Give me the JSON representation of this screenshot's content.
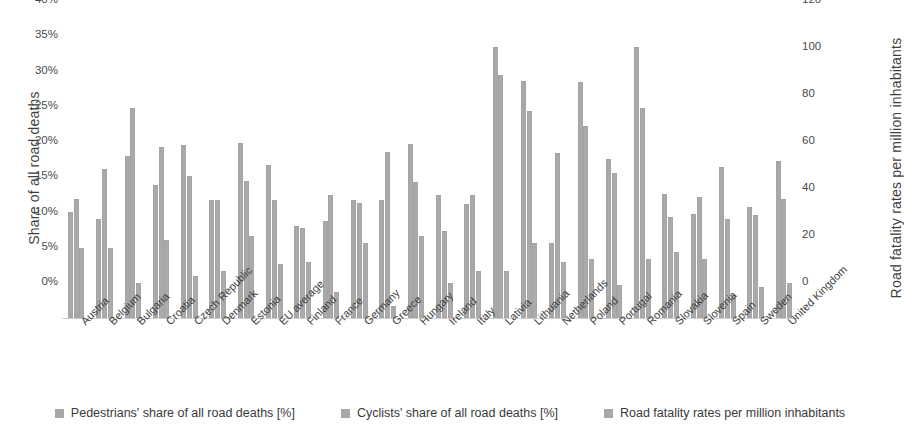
{
  "chart_data": {
    "type": "bar",
    "title": "",
    "xlabel": "",
    "ylabel": "Share of all road deaths",
    "ylabel_secondary": "Road fatality rates per million inhabitants",
    "ylim": [
      0,
      40
    ],
    "ylim_secondary": [
      0,
      120
    ],
    "yticks": [
      "0%",
      "5%",
      "10%",
      "15%",
      "20%",
      "25%",
      "30%",
      "35%",
      "40%"
    ],
    "ytick_values": [
      0,
      5,
      10,
      15,
      20,
      25,
      30,
      35,
      40
    ],
    "yticks_secondary": [
      "0",
      "20",
      "40",
      "60",
      "80",
      "100",
      "120"
    ],
    "ytick_values_secondary": [
      0,
      20,
      40,
      60,
      80,
      100,
      120
    ],
    "grid": false,
    "legend_position": "bottom",
    "bar_color": "#a8a8a8",
    "categories": [
      "Austria",
      "Belgium",
      "Bulgaria",
      "Croatia",
      "Czech Republic",
      "Denmark",
      "Estonia",
      "EU average",
      "Finland",
      "France",
      "Germany",
      "Greece",
      "Hungary",
      "Ireland",
      "Italy",
      "Lativia",
      "Lithuania",
      "Netherlands",
      "Poland",
      "Portugal",
      "Romania",
      "Slovakia",
      "Slovenia",
      "Spain",
      "Sweden",
      "United Kingdom"
    ],
    "series": [
      {
        "name": "Pedestrians' share of all road deaths [%]",
        "axis": "left",
        "unit": "%",
        "values": [
          15.0,
          14.0,
          23.0,
          18.9,
          24.5,
          16.8,
          24.8,
          21.7,
          13.1,
          13.8,
          16.7,
          16.7,
          24.7,
          17.5,
          16.2,
          38.5,
          33.6,
          10.7,
          33.5,
          22.5,
          38.4,
          17.6,
          14.7,
          21.4,
          15.7,
          22.3
        ]
      },
      {
        "name": "Cyclists' share of all road deaths [%]",
        "axis": "left",
        "unit": "%",
        "values": [
          16.9,
          21.1,
          29.8,
          24.2,
          20.2,
          16.8,
          19.5,
          16.8,
          12.8,
          17.4,
          16.3,
          23.5,
          19.3,
          12.4,
          17.5,
          34.5,
          29.4,
          23.4,
          27.3,
          20.6,
          29.8,
          14.3,
          17.1,
          14.0,
          14.6,
          16.9
        ]
      },
      {
        "name": "Road fatality rates per million inhabitants",
        "axis": "right",
        "unit": "per million inhabitants",
        "values": [
          30,
          30,
          15,
          33,
          18,
          20,
          35,
          23,
          24,
          11,
          32,
          5,
          35,
          15,
          20,
          20,
          32,
          24,
          25,
          14,
          25,
          28,
          25,
          10,
          13,
          15
        ]
      }
    ],
    "legend": [
      "Pedestrians' share of all road deaths [%]",
      "Cyclists' share of all road deaths [%]",
      "Road fatality rates per million inhabitants"
    ]
  }
}
